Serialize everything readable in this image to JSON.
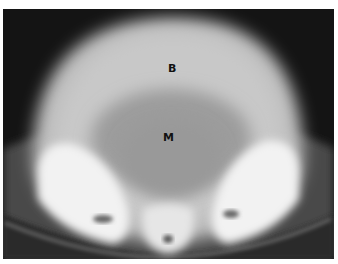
{
  "image": {
    "type": "CT scan, axial pelvis",
    "labels": [
      {
        "id": "B",
        "text": "B"
      },
      {
        "id": "M",
        "text": "M"
      }
    ]
  }
}
